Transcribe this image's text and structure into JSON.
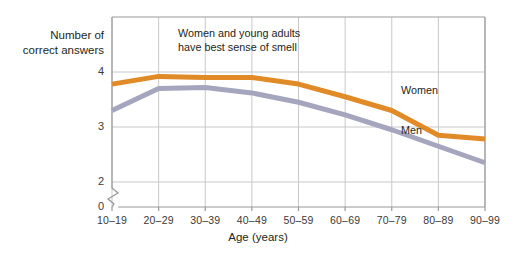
{
  "chart_data": {
    "type": "line",
    "title": "",
    "xlabel": "Age (years)",
    "ylabel": "Number of\ncorrect answers",
    "categories": [
      "10–19",
      "20–29",
      "30–39",
      "40–49",
      "50–59",
      "60–69",
      "70–79",
      "80–89",
      "90–99"
    ],
    "ytick_labels": [
      "0",
      "2",
      "3",
      "4"
    ],
    "ytick_values": [
      0,
      2,
      3,
      4
    ],
    "ylim": [
      2,
      4.35
    ],
    "y_axis_break": true,
    "grid": true,
    "legend_position": "inline-labels",
    "annotations": [
      {
        "text": "Women and young adults\nhave best sense of smell",
        "x_category": "30–39",
        "y_value": 4.2
      }
    ],
    "series": [
      {
        "name": "Women",
        "color": "#E08A28",
        "values": [
          3.78,
          3.92,
          3.9,
          3.9,
          3.78,
          3.55,
          3.3,
          2.85,
          2.78
        ]
      },
      {
        "name": "Men",
        "color": "#A5A5BE",
        "values": [
          3.3,
          3.7,
          3.72,
          3.62,
          3.45,
          3.22,
          2.95,
          2.65,
          2.35
        ]
      }
    ]
  },
  "style": {
    "grid_color": "#c8c8c8",
    "axis_color": "#9a9a9a",
    "text_color": "#231f20",
    "background": "#ffffff",
    "line_width": 5
  }
}
